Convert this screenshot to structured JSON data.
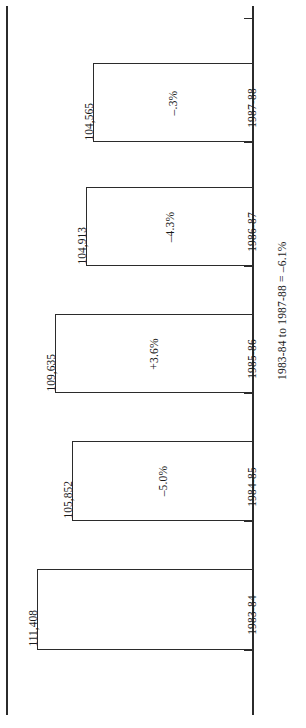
{
  "chart_data": {
    "type": "bar",
    "title": "",
    "subtitle": "",
    "xlabel": "",
    "ylabel": "",
    "orientation": "vertical-bars-rotated-90",
    "grid": false,
    "legend": null,
    "categories": [
      "1983-84",
      "1984-85",
      "1985-86",
      "1986-87",
      "1987-88"
    ],
    "values": [
      111408,
      105852,
      109635,
      104913,
      104565
    ],
    "value_labels": [
      "111,408",
      "105,852",
      "109,635",
      "104,913",
      "104,565"
    ],
    "change_labels": [
      "",
      "–5.0%",
      "+3.6%",
      "–4.3%",
      "–.3%"
    ],
    "ylim": [
      0,
      120000
    ],
    "annotation": "1983-84 to 1987-88 = –6.1%"
  },
  "chart": {
    "bars": [
      {
        "category": "1987-88",
        "value_label": "104,565",
        "change_label": "–.3%",
        "top": 63,
        "height": 79,
        "left": 93,
        "tick_y": 142,
        "label_y": 102
      },
      {
        "category": "1986-87",
        "value_label": "104,913",
        "change_label": "–4.3%",
        "top": 187,
        "height": 79,
        "left": 86,
        "tick_y": 266,
        "label_y": 226
      },
      {
        "category": "1985-86",
        "value_label": "109,635",
        "change_label": "+3.6%",
        "top": 314,
        "height": 79,
        "left": 55,
        "tick_y": 393,
        "label_y": 353
      },
      {
        "category": "1984-85",
        "value_label": "105,852",
        "change_label": "–5.0%",
        "top": 441,
        "height": 80,
        "left": 72,
        "tick_y": 521,
        "label_y": 481
      },
      {
        "category": "1983-84",
        "value_label": "111,408",
        "change_label": "",
        "top": 569,
        "height": 81,
        "left": 37,
        "tick_y": 650,
        "label_y": 609
      }
    ],
    "extra_ticks": [
      18,
      649
    ],
    "annotation": "1983-84 to 1987-88 = –6.1%",
    "axis_color": "#2b2b2b",
    "bar_fill": "#ffffff",
    "bar_stroke": "#2b2b2b"
  }
}
